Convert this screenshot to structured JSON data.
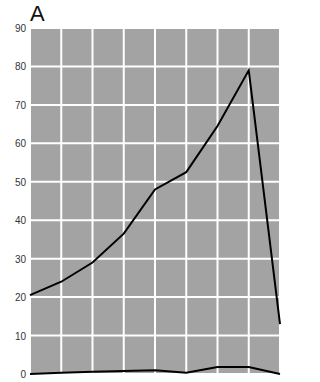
{
  "panel_label": "A",
  "colors": {
    "plot_bg": "#a3a3a3",
    "grid": "#ffffff",
    "line": "#000000"
  },
  "chart_data": {
    "type": "line",
    "title": "A",
    "xlabel": "",
    "ylabel": "",
    "ylim": [
      0,
      90
    ],
    "yticks": [
      0,
      10,
      20,
      30,
      40,
      50,
      60,
      70,
      80,
      90
    ],
    "x": [
      0,
      1,
      2,
      3,
      4,
      5,
      6,
      7,
      8
    ],
    "xlim": [
      0,
      8
    ],
    "grid": true,
    "legend": null,
    "series": [
      {
        "name": "series-upper",
        "values": [
          20.5,
          24,
          29,
          36.5,
          48,
          52.5,
          64.5,
          79,
          13
        ]
      },
      {
        "name": "series-lower",
        "values": [
          0,
          0.3,
          0.6,
          0.8,
          1,
          0.3,
          1.8,
          1.8,
          0
        ]
      }
    ]
  }
}
